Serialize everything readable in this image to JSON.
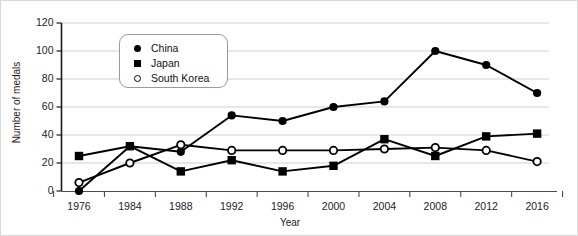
{
  "chart_data": {
    "type": "line",
    "title": "",
    "xlabel": "Year",
    "ylabel": "Number of medals",
    "categories": [
      "1976",
      "1984",
      "1988",
      "1992",
      "1996",
      "2000",
      "2004",
      "2008",
      "2012",
      "2016"
    ],
    "x": [
      1976,
      1984,
      1988,
      1992,
      1996,
      2000,
      2004,
      2008,
      2012,
      2016
    ],
    "ylim": [
      0,
      120
    ],
    "yticks": [
      0,
      20,
      40,
      60,
      80,
      100,
      120
    ],
    "grid": "horizontal",
    "legend_position": "upper-left-inside",
    "series": [
      {
        "name": "China",
        "marker": "filled-circle",
        "color": "#000000",
        "values": [
          0,
          32,
          28,
          54,
          50,
          60,
          64,
          100,
          90,
          70
        ]
      },
      {
        "name": "Japan",
        "marker": "filled-square",
        "color": "#000000",
        "values": [
          25,
          32,
          14,
          22,
          14,
          18,
          37,
          25,
          39,
          41
        ]
      },
      {
        "name": "South Korea",
        "marker": "open-circle",
        "color": "#000000",
        "values": [
          6,
          20,
          33,
          29,
          29,
          29,
          30,
          31,
          29,
          21
        ]
      }
    ]
  },
  "legend": {
    "items": [
      {
        "label": "China",
        "marker": "filled-circle"
      },
      {
        "label": "Japan",
        "marker": "filled-square"
      },
      {
        "label": "South Korea",
        "marker": "open-circle"
      }
    ]
  },
  "axes": {
    "y_title": "Number of medals",
    "x_title": "Year",
    "y_tick_labels": [
      "120",
      "100",
      "80",
      "60",
      "40",
      "20",
      "0"
    ],
    "x_tick_labels": [
      "1976",
      "1984",
      "1988",
      "1992",
      "1996",
      "2000",
      "2004",
      "2008",
      "2012",
      "2016"
    ]
  }
}
